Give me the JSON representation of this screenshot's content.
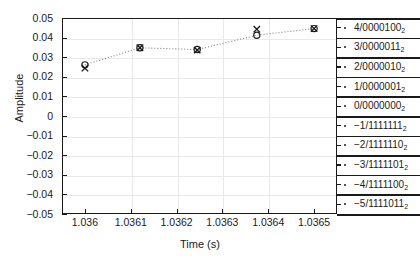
{
  "chart_data": {
    "type": "scatter",
    "title": "",
    "xlabel": "Time (s)",
    "ylabel": "Amplitude",
    "xlim": [
      1.03595,
      1.03655
    ],
    "ylim": [
      -0.05,
      0.05
    ],
    "grid": true,
    "legend": "none",
    "xticks": [
      "1.036",
      "1.0361",
      "1.0362",
      "1.0363",
      "1.0364",
      "1.0365"
    ],
    "xtick_values": [
      1.036,
      1.0361,
      1.0362,
      1.0363,
      1.0364,
      1.0365
    ],
    "yticks": [
      "0.05",
      "0.04",
      "0.03",
      "0.02",
      "0.01",
      "0",
      "-0.01",
      "-0.02",
      "-0.03",
      "-0.04",
      "-0.05"
    ],
    "ytick_values": [
      0.05,
      0.04,
      0.03,
      0.02,
      0.01,
      0,
      -0.01,
      -0.02,
      -0.03,
      -0.04,
      -0.05
    ],
    "x": [
      1.036,
      1.03612,
      1.036245,
      1.036375,
      1.0365
    ],
    "series": [
      {
        "name": "quantized-samples",
        "marker": "circle",
        "values": [
          0.0261,
          0.0348,
          0.0339,
          0.0412,
          0.0446
        ]
      },
      {
        "name": "original-samples",
        "marker": "x",
        "values": [
          0.0244,
          0.0348,
          0.0336,
          0.0443,
          0.0446
        ]
      }
    ],
    "connector": {
      "name": "interpolated-line",
      "style": "dotted",
      "color": "#808080"
    },
    "quantization_levels": [
      {
        "level": "4",
        "code": "0000100",
        "base": "2",
        "value": 0.0446
      },
      {
        "level": "3",
        "code": "0000011",
        "base": "2",
        "value": 0.0348
      },
      {
        "level": "2",
        "code": "0000010",
        "base": "2",
        "value": 0.0251
      },
      {
        "level": "1",
        "code": "0000001",
        "base": "2",
        "value": 0.0153
      },
      {
        "level": "0",
        "code": "0000000",
        "base": "2",
        "value": 0.0055
      },
      {
        "level": "-1",
        "code": "1111111",
        "base": "2",
        "value": -0.0043
      },
      {
        "level": "-2",
        "code": "1111110",
        "base": "2",
        "value": -0.0141
      },
      {
        "level": "-3",
        "code": "1111101",
        "base": "2",
        "value": -0.0239
      },
      {
        "level": "-4",
        "code": "1111100",
        "base": "2",
        "value": -0.0337
      },
      {
        "level": "-5",
        "code": "1111011",
        "base": "2",
        "value": -0.0435
      }
    ]
  }
}
